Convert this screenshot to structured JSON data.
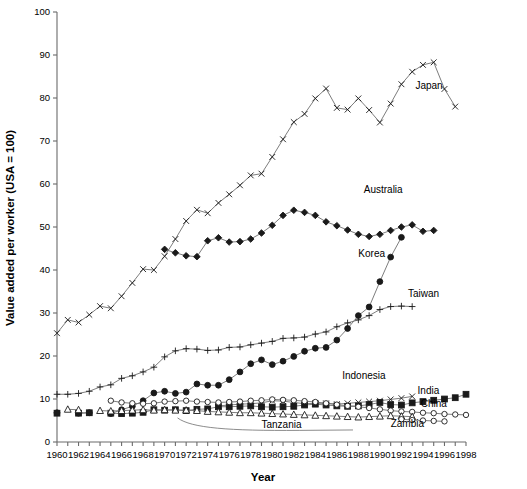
{
  "chart_data": {
    "type": "line",
    "title": "",
    "xlabel": "Year",
    "ylabel": "Value added per worker (USA = 100)",
    "xlim": [
      1960,
      1998
    ],
    "ylim": [
      0,
      100
    ],
    "yticks": [
      0,
      10,
      20,
      30,
      40,
      50,
      60,
      70,
      80,
      90,
      100
    ],
    "xticks": [
      1960,
      1962,
      1964,
      1966,
      1968,
      1970,
      1972,
      1974,
      1976,
      1978,
      1980,
      1982,
      1984,
      1986,
      1988,
      1990,
      1992,
      1994,
      1996,
      1998
    ],
    "xtick_minor_step": 1,
    "grid": false,
    "legend_position": "inline-right-labels",
    "x": [
      1960,
      1961,
      1962,
      1963,
      1964,
      1965,
      1966,
      1967,
      1968,
      1969,
      1970,
      1971,
      1972,
      1973,
      1974,
      1975,
      1976,
      1977,
      1978,
      1979,
      1980,
      1981,
      1982,
      1983,
      1984,
      1985,
      1986,
      1987,
      1988,
      1989,
      1990,
      1991,
      1992,
      1993,
      1994,
      1995,
      1996,
      1997,
      1998
    ],
    "series": [
      {
        "name": "Japan",
        "marker": "x-cross",
        "label_x": 1993.3,
        "label_y": 82,
        "values": [
          25.3,
          28.4,
          27.8,
          29.6,
          31.6,
          31.1,
          33.9,
          37.0,
          40.2,
          40.0,
          43.2,
          47.2,
          51.4,
          54.0,
          53.2,
          55.6,
          57.6,
          59.7,
          62.0,
          62.4,
          66.3,
          70.4,
          74.4,
          76.3,
          79.9,
          82.2,
          77.7,
          77.3,
          79.9,
          77.2,
          74.3,
          78.7,
          83.2,
          86.1,
          87.7,
          88.3,
          82.1,
          78.0,
          null
        ]
      },
      {
        "name": "Australia",
        "marker": "diamond",
        "label_x": 1988.5,
        "label_y": 58,
        "values": [
          null,
          null,
          null,
          null,
          null,
          null,
          null,
          null,
          null,
          null,
          44.8,
          44.0,
          43.3,
          43.1,
          46.8,
          47.5,
          46.5,
          46.6,
          47.2,
          48.6,
          50.4,
          52.7,
          53.9,
          53.4,
          52.7,
          51.2,
          50.3,
          49.3,
          48.3,
          47.8,
          48.3,
          49.2,
          50.0,
          50.5,
          49.0,
          49.2,
          null,
          null,
          null
        ]
      },
      {
        "name": "Korea",
        "marker": "circle-filled",
        "label_x": 1988.0,
        "label_y": 43,
        "values": [
          6.8,
          null,
          6.7,
          6.8,
          null,
          6.6,
          7.5,
          8.3,
          9.6,
          11.4,
          11.8,
          11.3,
          11.6,
          13.5,
          13.2,
          13.2,
          14.5,
          16.3,
          18.2,
          19.1,
          18.0,
          18.8,
          19.9,
          21.1,
          21.8,
          22.0,
          23.7,
          26.4,
          29.4,
          31.4,
          37.3,
          43.0,
          47.6,
          null,
          null,
          null,
          null,
          null,
          null
        ]
      },
      {
        "name": "Taiwan",
        "marker": "plus",
        "label_x": 1992.6,
        "label_y": 33.8,
        "values": [
          11.1,
          11.1,
          11.3,
          11.8,
          12.8,
          13.3,
          14.8,
          15.4,
          16.3,
          17.4,
          19.8,
          21.2,
          21.7,
          21.6,
          21.3,
          21.4,
          22.0,
          22.1,
          22.6,
          23.0,
          23.4,
          24.1,
          24.2,
          24.4,
          25.1,
          25.6,
          26.8,
          27.7,
          28.4,
          29.4,
          30.8,
          31.5,
          31.6,
          31.5,
          null,
          null,
          null,
          null,
          null
        ]
      },
      {
        "name": "Indonesia",
        "marker": "x-cross",
        "label_x": 1986.5,
        "label_y": 14.7,
        "values": [
          null,
          null,
          null,
          null,
          null,
          null,
          null,
          null,
          null,
          null,
          null,
          null,
          null,
          null,
          null,
          8.4,
          8.6,
          8.8,
          8.9,
          9.1,
          9.6,
          9.5,
          9.2,
          8.9,
          9.0,
          9.0,
          8.8,
          9.0,
          9.2,
          9.4,
          9.6,
          9.9,
          10.2,
          10.6,
          null,
          null,
          null,
          null,
          null
        ]
      },
      {
        "name": "India",
        "marker": "square-filled",
        "label_x": 1993.5,
        "label_y": 11.2,
        "values": [
          6.7,
          null,
          6.7,
          6.8,
          null,
          6.7,
          6.6,
          6.7,
          6.9,
          7.5,
          7.4,
          7.5,
          7.3,
          7.6,
          7.7,
          8.2,
          8.2,
          8.3,
          8.4,
          8.2,
          8.1,
          8.2,
          8.3,
          8.6,
          8.8,
          8.6,
          8.4,
          8.3,
          8.4,
          8.7,
          9.2,
          8.7,
          8.6,
          9.1,
          9.4,
          9.7,
          10.0,
          10.3,
          11.1
        ]
      },
      {
        "name": "China",
        "marker": "circle-open",
        "label_x": 1993.8,
        "label_y": 8.2,
        "values": [
          null,
          null,
          null,
          null,
          null,
          9.6,
          9.2,
          9.0,
          8.9,
          9.0,
          9.4,
          9.5,
          9.6,
          9.4,
          9.3,
          9.2,
          9.3,
          9.4,
          9.6,
          9.7,
          9.9,
          9.8,
          9.7,
          9.5,
          9.3,
          9.0,
          8.7,
          8.4,
          8.2,
          7.9,
          7.6,
          7.3,
          7.1,
          7.0,
          6.8,
          6.7,
          6.5,
          6.4,
          6.3
        ]
      },
      {
        "name": "Tanzania",
        "marker": "triangle-open",
        "label_x": 1979.0,
        "label_y": 3.2,
        "values": [
          null,
          7.6,
          7.5,
          null,
          7.3,
          7.2,
          7.3,
          7.4,
          7.5,
          7.4,
          7.5,
          7.4,
          7.4,
          7.3,
          7.1,
          7.0,
          6.9,
          6.8,
          6.8,
          6.7,
          6.6,
          6.5,
          6.4,
          6.3,
          6.2,
          6.1,
          6.0,
          5.9,
          5.8,
          5.9,
          6.0,
          6.1,
          6.0,
          5.9,
          null,
          null,
          null,
          null,
          null
        ]
      },
      {
        "name": "Zambia",
        "marker": "circle-open",
        "label_x": 1991.0,
        "label_y": 3.4,
        "values": [
          null,
          null,
          null,
          null,
          null,
          null,
          null,
          null,
          null,
          null,
          null,
          null,
          null,
          null,
          null,
          null,
          null,
          null,
          null,
          null,
          null,
          null,
          null,
          null,
          null,
          null,
          null,
          null,
          null,
          null,
          null,
          null,
          5.3,
          5.1,
          5.0,
          4.9,
          4.8,
          null,
          null
        ]
      }
    ]
  }
}
